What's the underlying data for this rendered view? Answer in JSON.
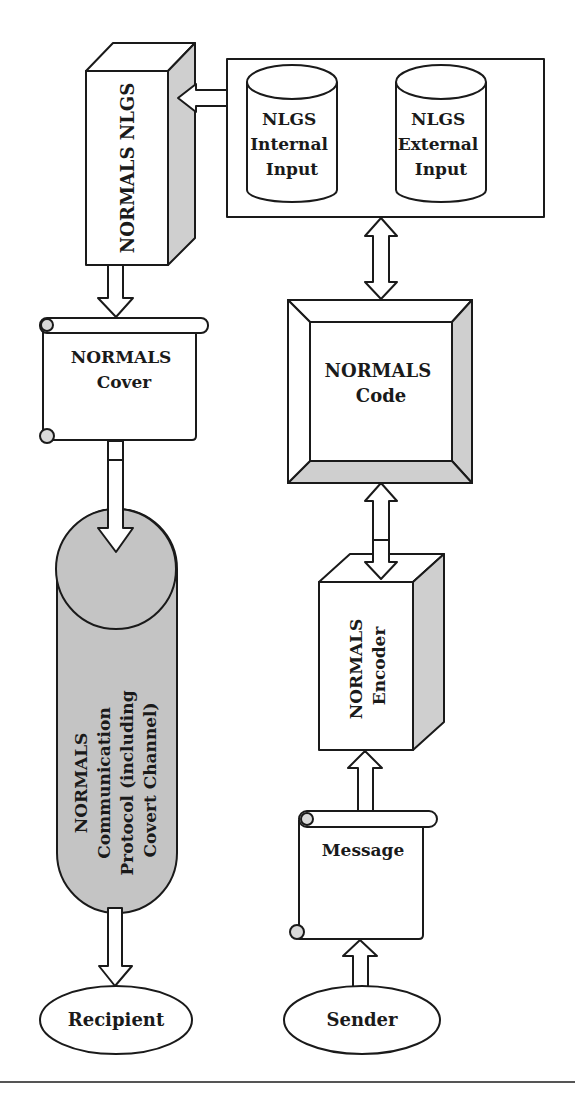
{
  "diagram": {
    "nodes": {
      "nlgs_block": {
        "label": "NORMALS NLGS"
      },
      "internal_input": {
        "lines": [
          "NLGS",
          "Internal",
          "Input"
        ]
      },
      "external_input": {
        "lines": [
          "NLGS",
          "External",
          "Input"
        ]
      },
      "cover": {
        "lines": [
          "NORMALS",
          "Cover"
        ]
      },
      "code": {
        "lines": [
          "NORMALS",
          "Code"
        ]
      },
      "protocol": {
        "lines": [
          "NORMALS",
          "Communication",
          "Protocol (including",
          "Covert Channel)"
        ]
      },
      "encoder": {
        "lines": [
          "NORMALS",
          "Encoder"
        ]
      },
      "message": {
        "label": "Message"
      },
      "recipient": {
        "label": "Recipient"
      },
      "sender": {
        "label": "Sender"
      }
    },
    "edges": [
      {
        "from": "input_container",
        "to": "nlgs_block",
        "type": "single-arrow"
      },
      {
        "from": "nlgs_block",
        "to": "cover",
        "type": "single-arrow"
      },
      {
        "from": "cover",
        "to": "protocol",
        "type": "single-arrow"
      },
      {
        "from": "protocol",
        "to": "recipient",
        "type": "single-arrow"
      },
      {
        "from": "input_container",
        "to": "code",
        "type": "double-arrow"
      },
      {
        "from": "code",
        "to": "encoder",
        "type": "double-arrow"
      },
      {
        "from": "message",
        "to": "encoder",
        "type": "single-arrow"
      },
      {
        "from": "sender",
        "to": "message",
        "type": "single-arrow"
      }
    ],
    "colors": {
      "stroke": "#1a1a1a",
      "shade": "#cfcfcf",
      "protocol_fill": "#c4c4c4",
      "background": "#ffffff"
    }
  }
}
